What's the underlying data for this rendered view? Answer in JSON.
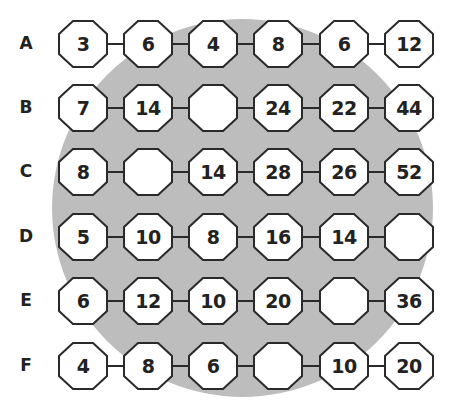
{
  "puzzle": {
    "rows": [
      {
        "label": "A",
        "cells": [
          "3",
          "6",
          "4",
          "8",
          "6",
          "12"
        ]
      },
      {
        "label": "B",
        "cells": [
          "7",
          "14",
          "",
          "24",
          "22",
          "44"
        ]
      },
      {
        "label": "C",
        "cells": [
          "8",
          "",
          "14",
          "28",
          "26",
          "52"
        ]
      },
      {
        "label": "D",
        "cells": [
          "5",
          "10",
          "8",
          "16",
          "14",
          ""
        ]
      },
      {
        "label": "E",
        "cells": [
          "6",
          "12",
          "10",
          "20",
          "",
          "36"
        ]
      },
      {
        "label": "F",
        "cells": [
          "4",
          "8",
          "6",
          "",
          "10",
          "20"
        ]
      }
    ]
  },
  "colors": {
    "background": "#ffffff",
    "circle": "#bdbdbd",
    "octagon_fill": "#ffffff",
    "octagon_stroke": "#2a2a2a",
    "text": "#222222"
  }
}
